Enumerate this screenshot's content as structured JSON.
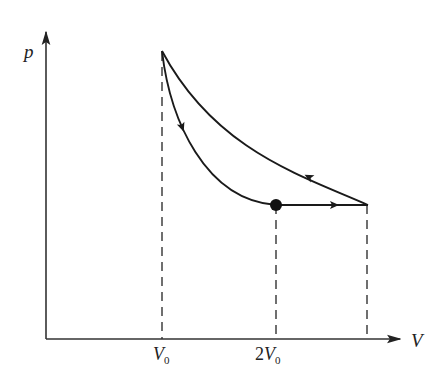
{
  "diagram": {
    "type": "p-V thermodynamic cycle",
    "axes": {
      "y_label": "p",
      "x_label": "V"
    },
    "ticks": [
      {
        "label_main": "V",
        "label_sub": "0",
        "prefix": ""
      },
      {
        "label_main": "V",
        "label_sub": "0",
        "prefix": "2"
      }
    ],
    "points": {
      "top": {
        "V": "V0",
        "note": "highest pressure"
      },
      "dot": {
        "V": "2V0",
        "note": "marked state on lower curve"
      },
      "right": {
        "V": "V_max",
        "note": "right end of horizontal segment"
      }
    },
    "processes": [
      {
        "from": "top",
        "to": "dot",
        "shape": "curve (steep, lower)",
        "direction": "downward"
      },
      {
        "from": "dot",
        "to": "right",
        "shape": "horizontal (isobaric)",
        "direction": "rightward"
      },
      {
        "from": "right",
        "to": "top",
        "shape": "curve (upper)",
        "direction": "up-left"
      }
    ],
    "colors": {
      "line": "#222222",
      "background": "#ffffff"
    }
  }
}
